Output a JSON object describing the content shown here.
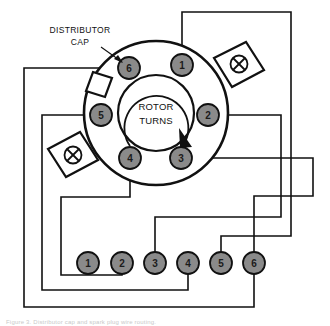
{
  "diagram": {
    "caption": "Figure 3. Distributor cap and spark plug wire routing.",
    "colors": {
      "terminal_fill": "#8a8a8a",
      "cylinder_fill": "#8a8a8a",
      "line": "#111111",
      "background": "#ffffff"
    },
    "callout": {
      "line1": "DISTRIBUTOR",
      "line2": "CAP"
    },
    "rotor": {
      "line1": "ROTOR",
      "line2": "TURNS",
      "direction": "clockwise"
    },
    "cap": {
      "center_x": 156,
      "center_y": 113,
      "outer_radius": 72,
      "inner_radius": 38,
      "terminals": [
        {
          "label": "1",
          "x": 182,
          "y": 65,
          "r": 11
        },
        {
          "label": "2",
          "x": 208,
          "y": 115,
          "r": 11
        },
        {
          "label": "3",
          "x": 181,
          "y": 158,
          "r": 11
        },
        {
          "label": "4",
          "x": 130,
          "y": 158,
          "r": 11
        },
        {
          "label": "5",
          "x": 101,
          "y": 115,
          "r": 11
        },
        {
          "label": "6",
          "x": 129,
          "y": 68,
          "r": 11
        }
      ]
    },
    "clamps": [
      {
        "name": "clamp-right",
        "screw_x": 239,
        "screw_y": 68
      },
      {
        "name": "clamp-left",
        "screw_x": 73,
        "screw_y": 160
      }
    ],
    "cylinders": [
      {
        "label": "1",
        "x": 88,
        "y": 263,
        "r": 11
      },
      {
        "label": "2",
        "x": 122,
        "y": 263,
        "r": 11
      },
      {
        "label": "3",
        "x": 155,
        "y": 263,
        "r": 11
      },
      {
        "label": "4",
        "x": 188,
        "y": 263,
        "r": 11
      },
      {
        "label": "5",
        "x": 221,
        "y": 263,
        "r": 11
      },
      {
        "label": "6",
        "x": 254,
        "y": 263,
        "r": 11
      }
    ],
    "wires": [
      {
        "name": "wire-terminal-1-to-cylinder-5",
        "from_terminal": "1",
        "to_cylinder": "5",
        "path": "M 182 54 L 182 12 L 291 12 L 291 236 L 221 236 L 221 252"
      },
      {
        "name": "wire-terminal-2-to-cylinder-3",
        "from_terminal": "2",
        "to_cylinder": "3",
        "path": "M 219 115 L 281 115 L 281 217 L 155 217 L 155 252"
      },
      {
        "name": "wire-terminal-3-to-cylinder-6",
        "from_terminal": "3",
        "to_cylinder": "6",
        "path": "M 192 158 L 313 158 L 313 196 L 254 196 L 254 252"
      },
      {
        "name": "wire-terminal-4-to-cylinder-2",
        "from_terminal": "4",
        "to_cylinder": "2",
        "path": "M 130 169 L 130 197 L 122 197 L 122 252"
      },
      {
        "name": "wire-terminal-5-to-cylinder-4",
        "from_terminal": "5",
        "to_cylinder": "4",
        "path": "M 90 115 L 42 115 L 42 290 L 188 290 L 188 274"
      },
      {
        "name": "wire-terminal-6-to-cylinder-1",
        "from_terminal": "6",
        "to_cylinder": "1",
        "path": "M 118 68 L 24 68 L 24 307 L 254 307 L 254 274"
      }
    ],
    "firing_order": [
      "1",
      "5",
      "3",
      "6",
      "2",
      "4"
    ]
  }
}
